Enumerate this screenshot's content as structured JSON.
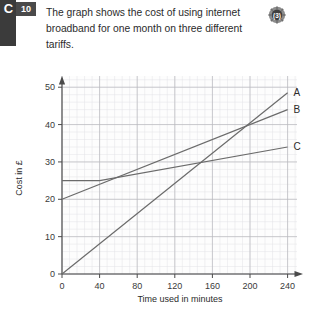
{
  "badge": {
    "letter": "C",
    "number": "10"
  },
  "question": {
    "text": "The graph shows the cost of using internet broadband for one month on three different tariffs."
  },
  "marks": {
    "icon": "gear-marks-icon",
    "value": "",
    "tail": ""
  },
  "colors": {
    "grid_minor": "#e2e2e6",
    "grid_major": "#b8b8bd",
    "axis": "#4a4a4a",
    "line": "#6b6b6b",
    "badge": "#3b3b3b",
    "text": "#2b2b2b"
  },
  "chart_data": {
    "type": "line",
    "title": "",
    "xlabel": "Time used in minutes",
    "ylabel": "Cost in £",
    "xlim": [
      0,
      250
    ],
    "ylim": [
      0,
      53
    ],
    "xticks": [
      0,
      40,
      80,
      120,
      160,
      200,
      240
    ],
    "yticks": [
      0,
      10,
      20,
      30,
      40,
      50
    ],
    "xtick_labels": [
      "0",
      "40",
      "80",
      "120",
      "160",
      "200",
      "240"
    ],
    "ytick_labels": [
      "0",
      "10",
      "20",
      "30",
      "40",
      "50"
    ],
    "grid": true,
    "grid_major_step_x": 40,
    "grid_major_step_y": 10,
    "grid_minor_step_x": 8,
    "grid_minor_step_y": 2,
    "legend_position": "right-end-of-line",
    "series": [
      {
        "name": "A",
        "label": "A",
        "points": [
          [
            0,
            0
          ],
          [
            240,
            48.5
          ]
        ]
      },
      {
        "name": "B",
        "label": "B",
        "points": [
          [
            0,
            20
          ],
          [
            240,
            44
          ]
        ]
      },
      {
        "name": "C",
        "label": "C",
        "points": [
          [
            0,
            25
          ],
          [
            40,
            25
          ],
          [
            240,
            34
          ]
        ]
      }
    ],
    "annotations": []
  }
}
